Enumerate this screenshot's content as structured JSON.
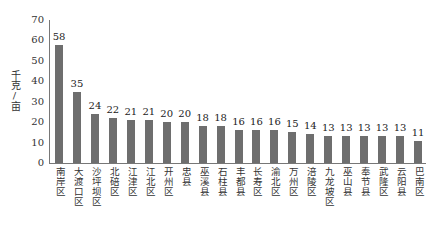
{
  "chart_data": {
    "type": "bar",
    "title": "",
    "xlabel": "",
    "ylabel": "千克/亩",
    "ylim": [
      0,
      70
    ],
    "yticks": [
      0,
      10,
      20,
      30,
      40,
      50,
      60,
      70
    ],
    "grid": false,
    "legend": null,
    "categories": [
      "南岸区",
      "大渡口区",
      "沙坪坝区",
      "北碚区",
      "江津区",
      "江北区",
      "开州区",
      "忠县",
      "巫溪县",
      "石柱县",
      "丰都县",
      "长寿区",
      "渝北区",
      "万州区",
      "涪陵区",
      "九龙坡区",
      "巫山县",
      "奉节县",
      "武隆区",
      "云阳县",
      "巴南区"
    ],
    "values": [
      58,
      35,
      24,
      22,
      21,
      21,
      20,
      20,
      18,
      18,
      16,
      16,
      16,
      15,
      14,
      13,
      13,
      13,
      13,
      13,
      11
    ],
    "data_labels": true,
    "bar_color": "#6e6e6e"
  }
}
